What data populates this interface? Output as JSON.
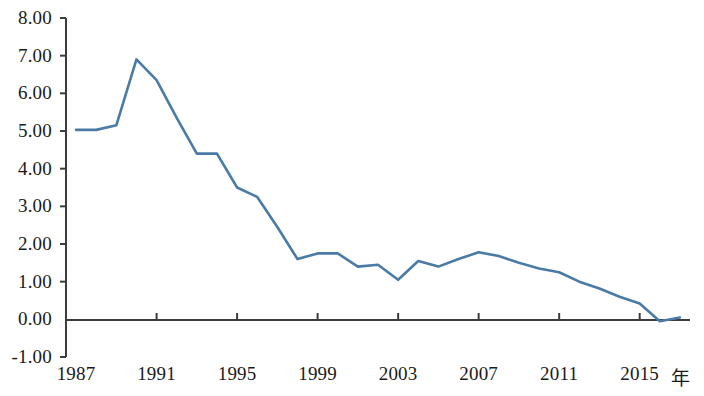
{
  "chart_data": {
    "type": "line",
    "title": "",
    "subtitle": "",
    "xlabel": "年",
    "ylabel": "",
    "xlim": [
      1986.5,
      2017.5
    ],
    "ylim": [
      -1.0,
      8.0
    ],
    "grid": false,
    "legend": null,
    "legend_position": "none",
    "line_color": "#4a7ba7",
    "axis_color": "#3c3c3c",
    "x_tick_labels": [
      "1987",
      "1991",
      "1995",
      "1999",
      "2003",
      "2007",
      "2011",
      "2015"
    ],
    "x_tick_values": [
      1987,
      1991,
      1995,
      1999,
      2003,
      2007,
      2011,
      2015
    ],
    "y_tick_labels": [
      "8.00",
      "7.00",
      "6.00",
      "5.00",
      "4.00",
      "3.00",
      "2.00",
      "1.00",
      "0.00",
      "-1.00"
    ],
    "y_tick_values": [
      8,
      7,
      6,
      5,
      4,
      3,
      2,
      1,
      0,
      -1
    ],
    "x": [
      1987,
      1988,
      1989,
      1990,
      1991,
      1992,
      1993,
      1994,
      1995,
      1996,
      1997,
      1998,
      1999,
      2000,
      2001,
      2002,
      2003,
      2004,
      2005,
      2006,
      2007,
      2008,
      2009,
      2010,
      2011,
      2012,
      2013,
      2014,
      2015,
      2016,
      2017
    ],
    "series": [
      {
        "name": "",
        "values": [
          5.03,
          5.03,
          5.15,
          6.9,
          6.35,
          5.35,
          4.4,
          4.4,
          3.5,
          3.25,
          2.45,
          1.6,
          1.75,
          1.75,
          1.4,
          1.45,
          1.05,
          1.55,
          1.4,
          1.6,
          1.78,
          1.68,
          1.5,
          1.35,
          1.25,
          1.0,
          0.82,
          0.6,
          0.42,
          -0.05,
          0.05
        ]
      }
    ],
    "annotations": []
  },
  "axis_labels": {
    "x_axis_unit": "年"
  }
}
